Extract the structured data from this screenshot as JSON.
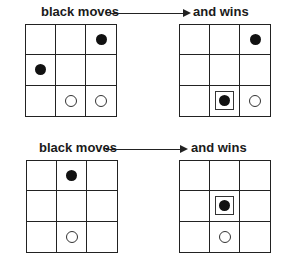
{
  "examples": [
    {
      "label_left": "black moves",
      "label_right": "and wins",
      "before": [
        [
          "",
          "",
          "black"
        ],
        [
          "black",
          "",
          ""
        ],
        [
          "",
          "white",
          "white"
        ]
      ],
      "after": [
        [
          "",
          "",
          "black"
        ],
        [
          "",
          "",
          ""
        ],
        [
          "",
          "black-new",
          "white"
        ]
      ]
    },
    {
      "label_left": "black moves",
      "label_right": "and wins",
      "before": [
        [
          "",
          "black",
          ""
        ],
        [
          "",
          "",
          ""
        ],
        [
          "",
          "white",
          ""
        ]
      ],
      "after": [
        [
          "",
          "",
          ""
        ],
        [
          "",
          "black-new",
          ""
        ],
        [
          "",
          "white",
          ""
        ]
      ]
    }
  ]
}
